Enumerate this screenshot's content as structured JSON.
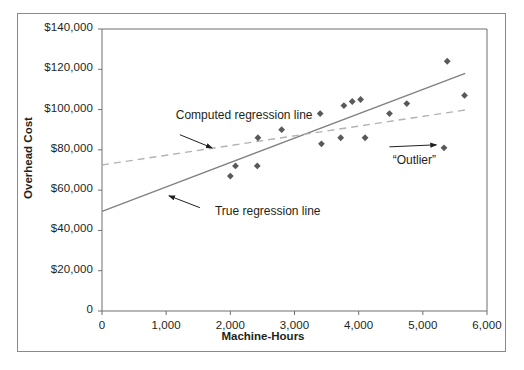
{
  "chart_data": {
    "type": "scatter",
    "title": "",
    "xlabel": "Machine-Hours",
    "ylabel": "Overhead Cost",
    "xlim": [
      0,
      6000
    ],
    "ylim": [
      0,
      140000
    ],
    "grid": false,
    "legend": "none",
    "x_tick_labels": [
      "0",
      "1,000",
      "2,000",
      "3,000",
      "4,000",
      "5,000",
      "6,000"
    ],
    "x_tick_values": [
      0,
      1000,
      2000,
      3000,
      4000,
      5000,
      6000
    ],
    "y_tick_labels": [
      "0",
      "$20,000",
      "$40,000",
      "$60,000",
      "$80,000",
      "$100,000",
      "$120,000",
      "$140,000"
    ],
    "y_tick_values": [
      0,
      20000,
      40000,
      60000,
      80000,
      100000,
      120000,
      140000
    ],
    "points": [
      {
        "x": 2000,
        "y": 67000
      },
      {
        "x": 2080,
        "y": 72000
      },
      {
        "x": 2420,
        "y": 72000
      },
      {
        "x": 2430,
        "y": 86000
      },
      {
        "x": 2800,
        "y": 90000
      },
      {
        "x": 3400,
        "y": 98000
      },
      {
        "x": 3420,
        "y": 83000
      },
      {
        "x": 3720,
        "y": 86000
      },
      {
        "x": 3770,
        "y": 102000
      },
      {
        "x": 3900,
        "y": 104000
      },
      {
        "x": 4030,
        "y": 105000
      },
      {
        "x": 4100,
        "y": 86000
      },
      {
        "x": 4480,
        "y": 98000
      },
      {
        "x": 4750,
        "y": 103000
      },
      {
        "x": 5380,
        "y": 124000
      },
      {
        "x": 5330,
        "y": 81000
      },
      {
        "x": 5650,
        "y": 107000
      }
    ],
    "series": [
      {
        "name": "True regression line",
        "type": "line",
        "style": "solid",
        "color": "#808080",
        "x": [
          0,
          5660
        ],
        "y": [
          49500,
          118000
        ]
      },
      {
        "name": "Computed regression line",
        "type": "line",
        "style": "dashed",
        "color": "#b3b3b3",
        "x": [
          0,
          5660
        ],
        "y": [
          72500,
          99800
        ]
      }
    ],
    "annotations": [
      {
        "id": "computed-regression-line",
        "text": "Computed regression line",
        "label_x": 1150,
        "label_y": 97000,
        "arrow_from_x": 1215,
        "arrow_from_y": 87500,
        "arrow_to_x": 1715,
        "arrow_to_y": 81000
      },
      {
        "id": "true-regression-line",
        "text": "True regression line",
        "label_x": 1760,
        "label_y": 49000,
        "arrow_from_x": 1525,
        "arrow_from_y": 51300,
        "arrow_to_x": 1045,
        "arrow_to_y": 57200
      },
      {
        "id": "outlier",
        "text": "“Outlier”",
        "label_x": 4530,
        "label_y": 74500,
        "arrow_from_x": 4480,
        "arrow_from_y": 81500,
        "arrow_to_x": 5210,
        "arrow_to_y": 82500
      }
    ]
  }
}
